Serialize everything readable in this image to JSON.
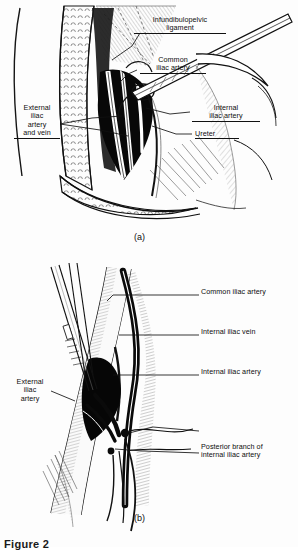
{
  "figure": {
    "type": "medical-line-illustration",
    "panels": [
      {
        "id": "a",
        "caption": "(a)",
        "labels": [
          {
            "name": "infundibulopelvic-ligament",
            "text": "Infundibulopelvic\nligament",
            "side": "right",
            "underline": true
          },
          {
            "name": "common-iliac-artery",
            "text": "Common\niliac artery",
            "side": "right",
            "underline": true
          },
          {
            "name": "internal-iliac-artery",
            "text": "Internal\niliac artery",
            "side": "right",
            "underline": true
          },
          {
            "name": "ureter",
            "text": "Ureter",
            "side": "right",
            "underline": true
          },
          {
            "name": "external-iliac-artery-and-vein",
            "text": "External\niliac\nartery\nand vein",
            "side": "left",
            "underline": true
          }
        ]
      },
      {
        "id": "b",
        "caption": "(b)",
        "labels": [
          {
            "name": "common-iliac-artery",
            "text": "Common iliac artery",
            "side": "right",
            "underline": false
          },
          {
            "name": "internal-iliac-vein",
            "text": "Internal iliac vein",
            "side": "right",
            "underline": false
          },
          {
            "name": "internal-iliac-artery",
            "text": "Internal iliac artery",
            "side": "right",
            "underline": false
          },
          {
            "name": "posterior-branch-of-internal-iliac-artery",
            "text": "Posterior branch of\ninternal iliac artery",
            "side": "right",
            "underline": false
          },
          {
            "name": "external-iliac-artery",
            "text": "External\niliac\nartery",
            "side": "left",
            "underline": false
          }
        ]
      }
    ],
    "footer_text": "Figure 2",
    "colors": {
      "ink": "#111111",
      "paper": "#fdfdfd",
      "shadow": "#000000"
    }
  }
}
